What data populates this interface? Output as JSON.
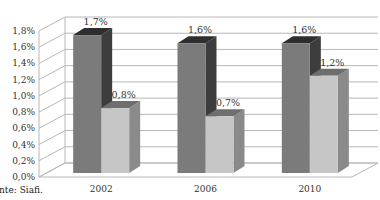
{
  "chart_data": {
    "type": "bar",
    "style": "3d-clustered-column",
    "title": "",
    "xlabel": "",
    "ylabel": "",
    "categories": [
      "2002",
      "2006",
      "2010"
    ],
    "series": [
      {
        "name": "Série 1",
        "values": [
          1.7,
          1.6,
          1.6
        ],
        "labels": [
          "1,7%",
          "1,6%",
          "1,6%"
        ],
        "color_front": "#7b7b7b",
        "color_side": "#3d3d3d",
        "color_top": "#2e2e2e"
      },
      {
        "name": "Série 2",
        "values": [
          0.8,
          0.7,
          1.2
        ],
        "labels": [
          "0,8%",
          "0,7%",
          "1,2%"
        ],
        "color_front": "#c6c6c6",
        "color_side": "#8a8a8a",
        "color_top": "#6e6e6e"
      }
    ],
    "ylim": [
      0,
      1.8
    ],
    "yticks": [
      0.0,
      0.2,
      0.4,
      0.6,
      0.8,
      1.0,
      1.2,
      1.4,
      1.6,
      1.8
    ],
    "ytick_labels": [
      "0,0%",
      "0,2%",
      "0,4%",
      "0,6%",
      "0,8%",
      "1,0%",
      "1,2%",
      "1,4%",
      "1,6%",
      "1,8%"
    ],
    "grid": true,
    "legend": "none"
  },
  "source_note": "nte: Siafi."
}
